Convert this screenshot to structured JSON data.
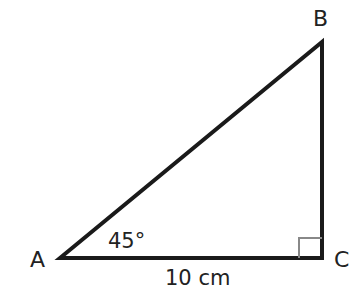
{
  "diagram": {
    "type": "right-triangle",
    "vertices": [
      {
        "name": "A",
        "x": 60,
        "y": 258
      },
      {
        "name": "B",
        "x": 322,
        "y": 42
      },
      {
        "name": "C",
        "x": 322,
        "y": 258
      }
    ],
    "labels": {
      "vertex_a": "A",
      "vertex_b": "B",
      "vertex_c": "C",
      "angle_a": "45°",
      "side_ac": "10 cm"
    },
    "right_angle_at": "C",
    "stroke_color": "#1a1a1a"
  }
}
